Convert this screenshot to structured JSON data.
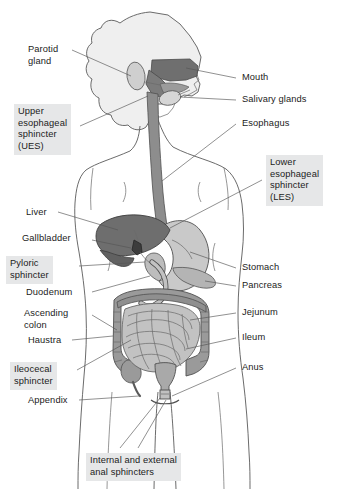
{
  "diagram": {
    "type": "anatomical-diagram",
    "colors": {
      "background": "#ffffff",
      "outline": "#5a5a5a",
      "label_text": "#1b1b1b",
      "label_box": "#e6e7e8",
      "leader_line": "#555555",
      "head": "#efefef",
      "oral_cavity_dark": "#6f6f6f",
      "esophagus": "#8d8d8d",
      "liver": "#6e6e6e",
      "gallbladder": "#3c3c3c",
      "stomach": "#c9c9c9",
      "pancreas": "#b4b4b4",
      "small_intestine": "#c2c2c2",
      "colon": "#9a9a9a",
      "rectum": "#a9a9a9"
    },
    "labels": {
      "parotid_gland": {
        "text": "Parotid\ngland",
        "side": "left",
        "boxed": false
      },
      "upper_esophageal_sphincter": {
        "text": "Upper\nesophageal\nsphincter\n(UES)",
        "side": "left",
        "boxed": true
      },
      "liver": {
        "text": "Liver",
        "side": "left",
        "boxed": false
      },
      "gallbladder": {
        "text": "Gallbladder",
        "side": "left",
        "boxed": false
      },
      "pyloric_sphincter": {
        "text": "Pyloric\nsphincter",
        "side": "left",
        "boxed": true
      },
      "duodenum": {
        "text": "Duodenum",
        "side": "left",
        "boxed": false
      },
      "ascending_colon": {
        "text": "Ascending\ncolon",
        "side": "left",
        "boxed": false
      },
      "haustra": {
        "text": "Haustra",
        "side": "left",
        "boxed": false
      },
      "ileocecal_sphincter": {
        "text": "Ileocecal\nsphincter",
        "side": "left",
        "boxed": true
      },
      "appendix": {
        "text": "Appendix",
        "side": "left",
        "boxed": false
      },
      "mouth": {
        "text": "Mouth",
        "side": "right",
        "boxed": false
      },
      "salivary_glands": {
        "text": "Salivary glands",
        "side": "right",
        "boxed": false
      },
      "esophagus": {
        "text": "Esophagus",
        "side": "right",
        "boxed": false
      },
      "lower_esophageal_sphincter": {
        "text": "Lower\nesophageal\nsphincter\n(LES)",
        "side": "right",
        "boxed": true
      },
      "stomach": {
        "text": "Stomach",
        "side": "right",
        "boxed": false
      },
      "pancreas": {
        "text": "Pancreas",
        "side": "right",
        "boxed": false
      },
      "jejunum": {
        "text": "Jejunum",
        "side": "right",
        "boxed": false
      },
      "ileum": {
        "text": "Ileum",
        "side": "right",
        "boxed": false
      },
      "anus": {
        "text": "Anus",
        "side": "right",
        "boxed": false
      },
      "anal_sphincters": {
        "text": "Internal and external\nanal sphincters",
        "side": "bottom",
        "boxed": true
      }
    },
    "structures": [
      "head",
      "oral-cavity",
      "tongue",
      "parotid-gland",
      "salivary-gland",
      "esophagus",
      "stomach",
      "liver",
      "gallbladder",
      "pancreas",
      "duodenum",
      "small-intestine",
      "colon",
      "cecum",
      "appendix",
      "rectum",
      "anus",
      "torso-outline",
      "legs"
    ]
  }
}
